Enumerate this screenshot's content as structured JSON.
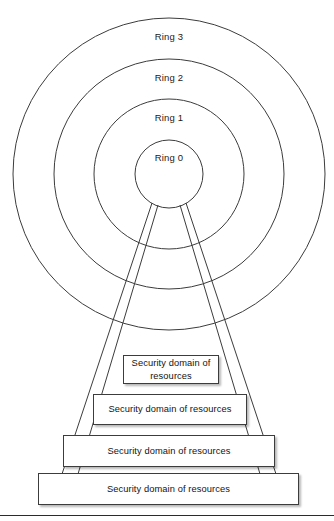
{
  "figure": {
    "rings": [
      {
        "label": "Ring 3",
        "radius": 156,
        "label_y": 31
      },
      {
        "label": "Ring 2",
        "radius": 115,
        "label_y": 72
      },
      {
        "label": "Ring 1",
        "radius": 75,
        "label_y": 112
      },
      {
        "label": "Ring 0",
        "radius": 34,
        "label_y": 152
      }
    ],
    "ring_center": {
      "x": 169,
      "y": 174
    },
    "domains": [
      {
        "label": "Security domain of resources",
        "x": 123,
        "y": 355,
        "width": 96,
        "height": 29
      },
      {
        "label": "Security domain of resources",
        "x": 93,
        "y": 394,
        "width": 154,
        "height": 31
      },
      {
        "label": "Security domain of resources",
        "x": 63,
        "y": 435,
        "width": 212,
        "height": 32
      },
      {
        "label": "Security domain of resources",
        "x": 38,
        "y": 473,
        "width": 261,
        "height": 32
      }
    ],
    "cone_lines": [
      {
        "x1": 152,
        "y1": 203,
        "x2": 62,
        "y2": 473
      },
      {
        "x1": 158,
        "y1": 205,
        "x2": 78,
        "y2": 473
      },
      {
        "x1": 180,
        "y1": 205,
        "x2": 260,
        "y2": 473
      },
      {
        "x1": 186,
        "y1": 203,
        "x2": 276,
        "y2": 473
      }
    ],
    "footer_rule_y": 515,
    "colors": {
      "stroke": "#3c3c3c",
      "text": "#131313",
      "background": "#ffffff",
      "shadow": "rgba(0,0,0,0.28)"
    }
  }
}
